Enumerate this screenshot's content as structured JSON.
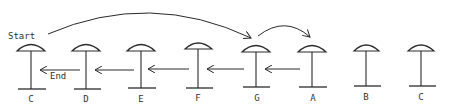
{
  "diagram": {
    "start_label": "Start",
    "end_label": "End",
    "ink_color": "#2a2a2a",
    "pillars": [
      {
        "label": "C",
        "x": 31
      },
      {
        "label": "D",
        "x": 86
      },
      {
        "label": "E",
        "x": 141
      },
      {
        "label": "F",
        "x": 198
      },
      {
        "label": "G",
        "x": 256
      },
      {
        "label": "A",
        "x": 312
      },
      {
        "label": "B",
        "x": 366
      },
      {
        "label": "C",
        "x": 421
      }
    ],
    "arrows": [
      {
        "type": "curve",
        "from": "Start",
        "to": "G"
      },
      {
        "type": "curve",
        "from": "G",
        "to": "A"
      },
      {
        "type": "straight",
        "from": "A",
        "to": "G"
      },
      {
        "type": "straight",
        "from": "G",
        "to": "F"
      },
      {
        "type": "straight",
        "from": "F",
        "to": "E"
      },
      {
        "type": "straight",
        "from": "E",
        "to": "D"
      },
      {
        "type": "straight",
        "from": "D",
        "to": "C"
      }
    ]
  }
}
